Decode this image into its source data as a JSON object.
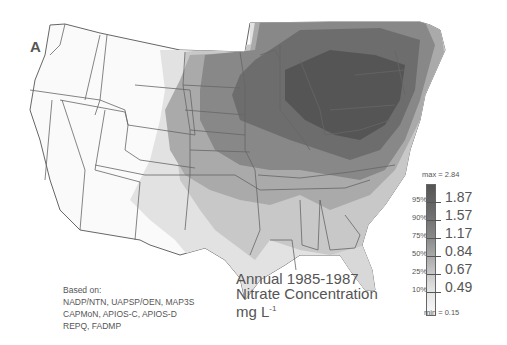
{
  "figure": {
    "panel_label": "A",
    "title_lines": [
      "Annual 1985-1987",
      "Nitrate Concentration"
    ],
    "units": "mg L",
    "units_exponent": "-1",
    "credits": {
      "heading": "Based on:",
      "lines": [
        "NADP/NTN, UAPSP/OEN, MAP3S",
        "CAPMoN, APIOS-C, APIOS-D",
        "REPQ, FADMP"
      ]
    }
  },
  "legend": {
    "max_label": "max = 2.84",
    "min_label": "min = 0.15",
    "classes": [
      {
        "percentile": "95%",
        "value": "1.87",
        "color": "#555555"
      },
      {
        "percentile": "90%",
        "value": "1.57",
        "color": "#6d6d6d"
      },
      {
        "percentile": "75%",
        "value": "1.17",
        "color": "#888888"
      },
      {
        "percentile": "50%",
        "value": "0.84",
        "color": "#aaaaaa"
      },
      {
        "percentile": "25%",
        "value": "0.67",
        "color": "#c8c8c8"
      },
      {
        "percentile": "10%",
        "value": "0.49",
        "color": "#e2e2e2"
      }
    ]
  },
  "map": {
    "region": "Contiguous United States and southeastern Canada",
    "variable": "Annual nitrate concentration in precipitation",
    "period": "1985-1987",
    "pattern": "Highest concentrations centered on Ohio Valley / lower Great Lakes / Pennsylvania-New York, decreasing westward and southward; lowest in western states and Florida/Gulf coast."
  }
}
